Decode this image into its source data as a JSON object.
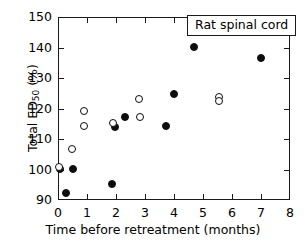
{
  "chart_data": {
    "type": "scatter",
    "title": "",
    "annotation": "Rat  spinal  cord",
    "xlabel_text": "Time before retreatment  (months)",
    "ylabel_text": "Total ED",
    "ylabel_sub": "50",
    "ylabel_unit": " (%)",
    "xlim": [
      0,
      8
    ],
    "ylim": [
      90,
      150
    ],
    "xticks": [
      0,
      1,
      2,
      3,
      4,
      5,
      6,
      7,
      8
    ],
    "yticks": [
      90,
      100,
      110,
      120,
      130,
      140,
      150
    ],
    "xtick_labels": [
      "0",
      "1",
      "2",
      "3",
      "4",
      "5",
      "6",
      "7",
      "8"
    ],
    "ytick_labels": [
      "90",
      "100",
      "110",
      "120",
      "130",
      "140",
      "150"
    ],
    "grid": false,
    "legend_position": "top-right",
    "series": [
      {
        "name": "filled",
        "marker": "filled-circle",
        "color": "#0d0d0d",
        "points": [
          {
            "x": 0.06,
            "y": 100.2
          },
          {
            "x": 0.28,
            "y": 92.2
          },
          {
            "x": 0.5,
            "y": 100.1
          },
          {
            "x": 1.87,
            "y": 95.4
          },
          {
            "x": 1.95,
            "y": 113.8
          },
          {
            "x": 2.3,
            "y": 117.1
          },
          {
            "x": 3.72,
            "y": 114.3
          },
          {
            "x": 4.0,
            "y": 124.7
          },
          {
            "x": 4.68,
            "y": 140.3
          },
          {
            "x": 7.0,
            "y": 136.4
          }
        ]
      },
      {
        "name": "open",
        "marker": "open-circle",
        "color": "#0d0d0d",
        "points": [
          {
            "x": 0.04,
            "y": 100.7
          },
          {
            "x": 0.47,
            "y": 106.7
          },
          {
            "x": 0.88,
            "y": 119.1
          },
          {
            "x": 0.9,
            "y": 114.2
          },
          {
            "x": 1.88,
            "y": 115.1
          },
          {
            "x": 2.78,
            "y": 123.2
          },
          {
            "x": 2.82,
            "y": 117.2
          },
          {
            "x": 5.55,
            "y": 123.9
          },
          {
            "x": 5.55,
            "y": 122.3
          }
        ]
      }
    ]
  },
  "legend": {
    "label": "Rat  spinal  cord"
  }
}
